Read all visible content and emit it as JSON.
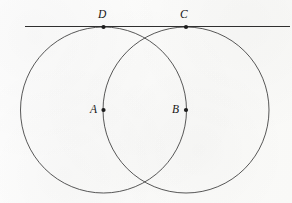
{
  "figure": {
    "background_color": "#fcfcfb",
    "stroke_color": "#3a3a3a",
    "line_color": "#2f2f2f",
    "dot_color": "#1c1c1c",
    "width": 292,
    "height": 203
  },
  "tangent_line": {
    "name": "tangent-line",
    "x1": 25,
    "y1": 26.5,
    "x2": 290,
    "y2": 26.5
  },
  "circles": [
    {
      "id": "circle-a",
      "center_label": "A",
      "cx": 103.5,
      "cy": 110,
      "r": 83
    },
    {
      "id": "circle-b",
      "center_label": "B",
      "cx": 186,
      "cy": 110,
      "r": 83
    }
  ],
  "points": [
    {
      "id": "point-d",
      "label": "D",
      "x": 103.5,
      "y": 27,
      "label_x": 98,
      "label_y": 9,
      "dot_r": 2.1
    },
    {
      "id": "point-c",
      "label": "C",
      "x": 186,
      "y": 27,
      "label_x": 180,
      "label_y": 9,
      "dot_r": 2.1
    },
    {
      "id": "point-a",
      "label": "A",
      "x": 103.5,
      "y": 110,
      "label_x": 90,
      "label_y": 104,
      "dot_r": 2.1
    },
    {
      "id": "point-b",
      "label": "B",
      "x": 186,
      "y": 110,
      "label_x": 172,
      "label_y": 104,
      "dot_r": 2.1
    }
  ]
}
